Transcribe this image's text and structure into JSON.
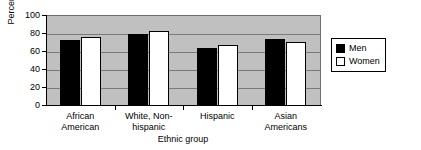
{
  "chart_data": {
    "type": "bar",
    "title": "",
    "xlabel": "Ethnic group",
    "ylabel": "Percent",
    "ylim": [
      0,
      100
    ],
    "ytick_step": 20,
    "yticks": [
      100,
      80,
      60,
      40,
      20,
      0
    ],
    "grid": true,
    "legend_position": "right",
    "categories": [
      "African\nAmerican",
      "White, Non-\nhispanic",
      "Hispanic",
      "Asian\nAmericans"
    ],
    "series": [
      {
        "name": "Men",
        "color": "#000000",
        "values": [
          73,
          80,
          65,
          75
        ]
      },
      {
        "name": "Women",
        "color": "#ffffff",
        "values": [
          77,
          83,
          68,
          71
        ]
      }
    ],
    "plot_background": "#c0c0c0",
    "gridline_color": "#7a7a7a"
  },
  "legend": {
    "items": [
      {
        "label": "Men",
        "swatch": "men"
      },
      {
        "label": "Women",
        "swatch": "women"
      }
    ]
  }
}
